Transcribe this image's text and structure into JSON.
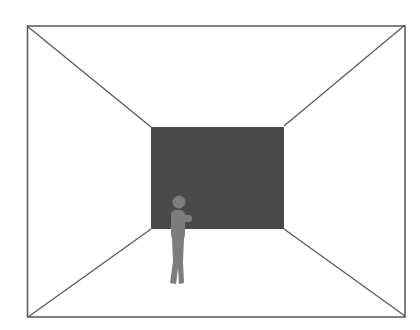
{
  "diagram": {
    "colors": {
      "background": "#ffffff",
      "line": "#555555",
      "back_wall": "#4a4a4a",
      "figure": "#7d7d7d"
    },
    "outer_frame": {
      "x1": 27,
      "y1": 26,
      "x2": 405,
      "y2": 317
    },
    "back_wall": {
      "x1": 151,
      "y1": 127,
      "x2": 284,
      "y2": 229
    },
    "figure": {
      "head": {
        "cx": 179,
        "cy": 202,
        "r": 6
      },
      "torso": {
        "x": 171,
        "y": 210,
        "w": 14,
        "h": 29
      },
      "arm": {
        "x": 183,
        "y": 214,
        "w": 9,
        "h": 8
      },
      "legs_top_y": 238,
      "feet_y": 284
    }
  }
}
